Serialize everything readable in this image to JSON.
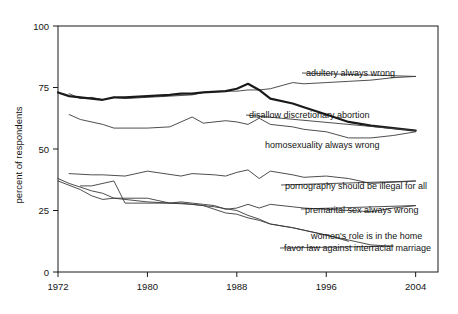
{
  "chart_data": {
    "type": "line",
    "title": "",
    "xlabel": "",
    "ylabel": "percent of respondents",
    "xlim": [
      1972,
      2006
    ],
    "ylim": [
      0,
      100
    ],
    "grid": false,
    "legend_position": "right-inline-labels",
    "xticks": [
      "1972",
      "1980",
      "1988",
      "1996",
      "2004"
    ],
    "xtick_values": [
      1972,
      1980,
      1988,
      1996,
      2004
    ],
    "yticks": [
      "0",
      "25",
      "50",
      "75",
      "100"
    ],
    "ytick_values": [
      0,
      25,
      50,
      75,
      100
    ],
    "series": [
      {
        "name": "adultery always wrong",
        "label": "adultery always wrong",
        "emphasis": "normal",
        "color": "#3a3a3a",
        "label_x": 2006,
        "label_y": 79,
        "x": [
          1973,
          1974,
          1975,
          1976,
          1977,
          1978,
          1980,
          1982,
          1984,
          1985,
          1987,
          1988,
          1989,
          1990,
          1991,
          1993,
          1994,
          1996,
          1998,
          2000,
          2002,
          2004
        ],
        "values": [
          72.5,
          70.5,
          71,
          70,
          71,
          70.5,
          71,
          71.5,
          72,
          73,
          73.5,
          73.5,
          74,
          74,
          74.5,
          77,
          76.5,
          77,
          77.5,
          78,
          79,
          79.5
        ]
      },
      {
        "name": "disallow discretionary abortion",
        "label": "disallow discretionary abortion",
        "emphasis": "bold",
        "color": "#1a1a1a",
        "label_x": 2006,
        "label_y": 63,
        "x": [
          1972,
          1973,
          1974,
          1975,
          1976,
          1977,
          1978,
          1980,
          1982,
          1983,
          1984,
          1985,
          1987,
          1988,
          1989,
          1990,
          1991,
          1993,
          1994,
          1996,
          1998,
          2000,
          2002,
          2004
        ],
        "values": [
          73,
          71.5,
          71,
          70.5,
          70,
          71,
          71,
          71.5,
          72,
          72.5,
          72.5,
          73,
          73.5,
          74.5,
          76.5,
          74,
          70.5,
          68.5,
          67,
          64,
          61,
          59.5,
          58.5,
          57.5
        ]
      },
      {
        "name": "homosexuality always wrong",
        "label": "homosexuality always wrong",
        "emphasis": "normal",
        "color": "#3a3a3a",
        "label_x": 2006,
        "label_y": 54,
        "x": [
          1973,
          1974,
          1976,
          1977,
          1980,
          1982,
          1984,
          1985,
          1987,
          1988,
          1989,
          1990,
          1991,
          1993,
          1994,
          1996,
          1998,
          2000,
          2002,
          2004
        ],
        "values": [
          64,
          62,
          60,
          58.5,
          58.5,
          59,
          63,
          60.5,
          61.5,
          61,
          60,
          62.5,
          60,
          59,
          58,
          57,
          54.5,
          54.5,
          55.5,
          57
        ]
      },
      {
        "name": "pornography should be illegal for all",
        "label": "pornography should be illegal for all",
        "emphasis": "normal",
        "color": "#3a3a3a",
        "label_x": 2006,
        "label_y": 36,
        "x": [
          1973,
          1975,
          1976,
          1978,
          1980,
          1983,
          1984,
          1986,
          1987,
          1988,
          1989,
          1990,
          1991,
          1993,
          1994,
          1996,
          1998,
          2000,
          2002,
          2004
        ],
        "values": [
          40,
          39.5,
          39.5,
          39,
          41,
          39,
          40,
          39.5,
          39,
          40.5,
          41.5,
          38,
          41,
          39.5,
          38.5,
          39,
          38,
          36,
          36.5,
          37
        ]
      },
      {
        "name": "premarital sex always wrong",
        "label": "premarital sex always wrong",
        "emphasis": "normal",
        "color": "#3a3a3a",
        "label_x": 2006,
        "label_y": 27,
        "x": [
          1972,
          1974,
          1975,
          1976,
          1977,
          1978,
          1980,
          1982,
          1983,
          1984,
          1985,
          1986,
          1987,
          1988,
          1989,
          1990,
          1991,
          1993,
          1994,
          1996,
          1998,
          2000,
          2002,
          2004
        ],
        "values": [
          37,
          33.5,
          31,
          29.5,
          30,
          29.5,
          28.5,
          28,
          28.5,
          28,
          27.5,
          27,
          25.5,
          26,
          27.5,
          26,
          27.5,
          26.5,
          26,
          25.5,
          25,
          24.5,
          26,
          27
        ]
      },
      {
        "name": "women's role is in the home",
        "label": "women's role is in the home",
        "emphasis": "normal",
        "color": "#3a3a3a",
        "label_x": 2006,
        "label_y": 17,
        "x": [
          1974,
          1975,
          1977,
          1978,
          1982,
          1983,
          1985,
          1986,
          1988,
          1989,
          1990,
          1991,
          1993,
          1994,
          1996,
          1998
        ],
        "values": [
          35,
          35,
          37,
          28,
          28,
          28,
          27,
          26.5,
          25,
          23,
          21.5,
          19.5,
          18,
          17,
          15,
          12.5
        ]
      },
      {
        "name": "favor law against interracial marriage",
        "label": "favor law against interracial marriage",
        "emphasis": "normal",
        "color": "#3a3a3a",
        "label_x": 2006,
        "label_y": 12,
        "x": [
          1972,
          1973,
          1974,
          1975,
          1976,
          1977,
          1980,
          1982,
          1984,
          1985,
          1987,
          1988,
          1989,
          1990,
          1991,
          1993,
          1994,
          1996,
          1998,
          2000,
          2002
        ],
        "values": [
          38,
          36,
          34.5,
          33,
          32,
          30,
          30,
          28,
          27.5,
          27,
          24,
          23.5,
          22,
          21,
          19.5,
          18,
          17,
          15,
          13,
          11,
          10.5
        ]
      }
    ],
    "labels": [
      {
        "text": "adultery always wrong",
        "id": "adultery-label"
      },
      {
        "text": "disallow discretionary abortion",
        "id": "abortion-label"
      },
      {
        "text": "homosexuality always wrong",
        "id": "homosexuality-label"
      },
      {
        "text": "pornography should be illegal for all",
        "id": "pornography-label"
      },
      {
        "text": "premarital sex always wrong",
        "id": "premarital-label"
      },
      {
        "text": "women's role is in the home",
        "id": "women-role-label"
      },
      {
        "text": "favor law against interracial marriage",
        "id": "interracial-label"
      }
    ]
  },
  "axis": {
    "ylabel": "percent of respondents",
    "ytick_0": "0",
    "ytick_25": "25",
    "ytick_50": "50",
    "ytick_75": "75",
    "ytick_100": "100",
    "xtick_1972": "1972",
    "xtick_1980": "1980",
    "xtick_1988": "1988",
    "xtick_1996": "1996",
    "xtick_2004": "2004"
  },
  "series_labels": {
    "adultery": "adultery always wrong",
    "abortion": "disallow discretionary abortion",
    "homosexuality": "homosexuality always wrong",
    "pornography": "pornography should be illegal for all",
    "premarital": "premarital sex always wrong",
    "women_role": "women's role is in the home",
    "interracial": "favor law against interracial marriage"
  },
  "colors": {
    "line": "#3a3a3a",
    "line_bold": "#1a1a1a",
    "axis": "#1a1a1a",
    "text": "#141414",
    "background": "#ffffff"
  }
}
